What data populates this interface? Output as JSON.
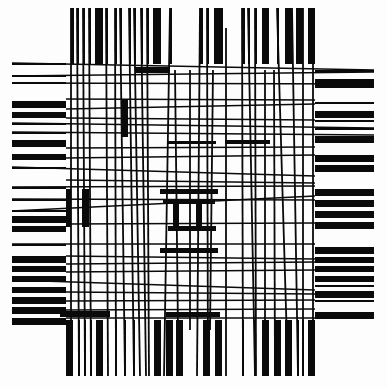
{
  "artwork": {
    "width": 387,
    "height": 389,
    "background": "#fdfdfd",
    "ink": "#0a0a0a",
    "top_bars": [
      {
        "x": 71,
        "w": 3
      },
      {
        "x": 77,
        "w": 2
      },
      {
        "x": 83,
        "w": 2
      },
      {
        "x": 89,
        "w": 2
      },
      {
        "x": 95,
        "w": 8
      },
      {
        "x": 106,
        "w": 2
      },
      {
        "x": 115,
        "w": 2
      },
      {
        "x": 120,
        "w": 2
      },
      {
        "x": 129,
        "w": 2
      },
      {
        "x": 134,
        "w": 2
      },
      {
        "x": 141,
        "w": 2
      },
      {
        "x": 147,
        "w": 2
      },
      {
        "x": 153,
        "w": 8
      },
      {
        "x": 170,
        "w": 2
      },
      {
        "x": 200,
        "w": 3
      },
      {
        "x": 207,
        "w": 2
      },
      {
        "x": 214,
        "w": 9
      },
      {
        "x": 242,
        "w": 3
      },
      {
        "x": 248,
        "w": 2
      },
      {
        "x": 255,
        "w": 2
      },
      {
        "x": 262,
        "w": 7
      },
      {
        "x": 277,
        "w": 2
      },
      {
        "x": 285,
        "w": 7
      },
      {
        "x": 296,
        "w": 7
      },
      {
        "x": 308,
        "w": 7
      }
    ],
    "bottom_bars": [
      {
        "x": 66,
        "w": 7
      },
      {
        "x": 78,
        "w": 2
      },
      {
        "x": 84,
        "w": 2
      },
      {
        "x": 90,
        "w": 2
      },
      {
        "x": 96,
        "w": 7
      },
      {
        "x": 115,
        "w": 2
      },
      {
        "x": 124,
        "w": 2
      },
      {
        "x": 133,
        "w": 2
      },
      {
        "x": 154,
        "w": 7
      },
      {
        "x": 166,
        "w": 7
      },
      {
        "x": 176,
        "w": 7
      },
      {
        "x": 203,
        "w": 7
      },
      {
        "x": 215,
        "w": 7
      },
      {
        "x": 242,
        "w": 2
      },
      {
        "x": 254,
        "w": 2
      },
      {
        "x": 262,
        "w": 7
      },
      {
        "x": 274,
        "w": 7
      },
      {
        "x": 285,
        "w": 7
      },
      {
        "x": 297,
        "w": 2
      },
      {
        "x": 302,
        "w": 2
      },
      {
        "x": 308,
        "w": 7
      }
    ],
    "left_bars": [
      {
        "y": 63,
        "h": 2
      },
      {
        "y": 75,
        "h": 2
      },
      {
        "y": 82,
        "h": 2
      },
      {
        "y": 101,
        "h": 7
      },
      {
        "y": 112,
        "h": 6
      },
      {
        "y": 123,
        "h": 2
      },
      {
        "y": 132,
        "h": 2
      },
      {
        "y": 140,
        "h": 7
      },
      {
        "y": 154,
        "h": 6
      },
      {
        "y": 167,
        "h": 2
      },
      {
        "y": 187,
        "h": 2
      },
      {
        "y": 199,
        "h": 2
      },
      {
        "y": 210,
        "h": 2
      },
      {
        "y": 216,
        "h": 7
      },
      {
        "y": 226,
        "h": 6
      },
      {
        "y": 244,
        "h": 2
      },
      {
        "y": 256,
        "h": 7
      },
      {
        "y": 266,
        "h": 6
      },
      {
        "y": 276,
        "h": 6
      },
      {
        "y": 287,
        "h": 6
      },
      {
        "y": 297,
        "h": 7
      },
      {
        "y": 307,
        "h": 7
      },
      {
        "y": 318,
        "h": 7
      }
    ],
    "right_bars": [
      {
        "y": 70,
        "h": 2
      },
      {
        "y": 79,
        "h": 9
      },
      {
        "y": 102,
        "h": 2
      },
      {
        "y": 111,
        "h": 7
      },
      {
        "y": 120,
        "h": 2
      },
      {
        "y": 128,
        "h": 2
      },
      {
        "y": 136,
        "h": 7
      },
      {
        "y": 155,
        "h": 7
      },
      {
        "y": 165,
        "h": 7
      },
      {
        "y": 189,
        "h": 7
      },
      {
        "y": 200,
        "h": 7
      },
      {
        "y": 211,
        "h": 7
      },
      {
        "y": 222,
        "h": 7
      },
      {
        "y": 247,
        "h": 7
      },
      {
        "y": 257,
        "h": 6
      },
      {
        "y": 266,
        "h": 6
      },
      {
        "y": 276,
        "h": 6
      },
      {
        "y": 285,
        "h": 2
      },
      {
        "y": 291,
        "h": 7
      },
      {
        "y": 300,
        "h": 2
      },
      {
        "y": 312,
        "h": 7
      }
    ],
    "h_lines": [
      {
        "x1": 12,
        "y1": 63,
        "x2": 374,
        "y2": 70
      },
      {
        "x1": 12,
        "y1": 76,
        "x2": 374,
        "y2": 72
      },
      {
        "x1": 12,
        "y1": 83,
        "x2": 374,
        "y2": 84
      },
      {
        "x1": 66,
        "y1": 99,
        "x2": 315,
        "y2": 100
      },
      {
        "x1": 66,
        "y1": 109,
        "x2": 315,
        "y2": 104
      },
      {
        "x1": 66,
        "y1": 118,
        "x2": 315,
        "y2": 120
      },
      {
        "x1": 12,
        "y1": 123,
        "x2": 374,
        "y2": 128
      },
      {
        "x1": 12,
        "y1": 132,
        "x2": 374,
        "y2": 135
      },
      {
        "x1": 66,
        "y1": 148,
        "x2": 315,
        "y2": 147
      },
      {
        "x1": 66,
        "y1": 158,
        "x2": 315,
        "y2": 155
      },
      {
        "x1": 12,
        "y1": 167,
        "x2": 315,
        "y2": 176
      },
      {
        "x1": 66,
        "y1": 180,
        "x2": 315,
        "y2": 183
      },
      {
        "x1": 12,
        "y1": 187,
        "x2": 315,
        "y2": 186
      },
      {
        "x1": 12,
        "y1": 199,
        "x2": 315,
        "y2": 200
      },
      {
        "x1": 12,
        "y1": 211,
        "x2": 315,
        "y2": 196
      },
      {
        "x1": 66,
        "y1": 224,
        "x2": 315,
        "y2": 223
      },
      {
        "x1": 12,
        "y1": 244,
        "x2": 315,
        "y2": 244
      },
      {
        "x1": 66,
        "y1": 256,
        "x2": 315,
        "y2": 259
      },
      {
        "x1": 66,
        "y1": 264,
        "x2": 315,
        "y2": 262
      },
      {
        "x1": 66,
        "y1": 272,
        "x2": 315,
        "y2": 270
      },
      {
        "x1": 12,
        "y1": 280,
        "x2": 315,
        "y2": 290
      },
      {
        "x1": 66,
        "y1": 292,
        "x2": 315,
        "y2": 294
      },
      {
        "x1": 66,
        "y1": 301,
        "x2": 315,
        "y2": 300
      },
      {
        "x1": 66,
        "y1": 310,
        "x2": 315,
        "y2": 309
      },
      {
        "x1": 66,
        "y1": 318,
        "x2": 315,
        "y2": 318
      }
    ],
    "v_lines": [
      {
        "x1": 71,
        "y1": 8,
        "x2": 71,
        "y2": 376
      },
      {
        "x1": 77,
        "y1": 8,
        "x2": 79,
        "y2": 376
      },
      {
        "x1": 83,
        "y1": 8,
        "x2": 85,
        "y2": 376
      },
      {
        "x1": 89,
        "y1": 8,
        "x2": 91,
        "y2": 376
      },
      {
        "x1": 106,
        "y1": 8,
        "x2": 108,
        "y2": 376
      },
      {
        "x1": 115,
        "y1": 8,
        "x2": 116,
        "y2": 376
      },
      {
        "x1": 120,
        "y1": 8,
        "x2": 125,
        "y2": 376
      },
      {
        "x1": 129,
        "y1": 8,
        "x2": 134,
        "y2": 376
      },
      {
        "x1": 134,
        "y1": 8,
        "x2": 140,
        "y2": 376
      },
      {
        "x1": 141,
        "y1": 8,
        "x2": 146,
        "y2": 376
      },
      {
        "x1": 147,
        "y1": 8,
        "x2": 149,
        "y2": 376
      },
      {
        "x1": 170,
        "y1": 8,
        "x2": 164,
        "y2": 376
      },
      {
        "x1": 200,
        "y1": 8,
        "x2": 197,
        "y2": 376
      },
      {
        "x1": 207,
        "y1": 8,
        "x2": 208,
        "y2": 376
      },
      {
        "x1": 242,
        "y1": 8,
        "x2": 243,
        "y2": 376
      },
      {
        "x1": 248,
        "y1": 8,
        "x2": 255,
        "y2": 376
      },
      {
        "x1": 255,
        "y1": 8,
        "x2": 256,
        "y2": 376
      },
      {
        "x1": 277,
        "y1": 8,
        "x2": 288,
        "y2": 376
      },
      {
        "x1": 292,
        "y1": 8,
        "x2": 298,
        "y2": 376
      },
      {
        "x1": 303,
        "y1": 8,
        "x2": 303,
        "y2": 376
      },
      {
        "x1": 313,
        "y1": 8,
        "x2": 313,
        "y2": 376
      },
      {
        "x1": 226,
        "y1": 28,
        "x2": 226,
        "y2": 376
      },
      {
        "x1": 190,
        "y1": 70,
        "x2": 190,
        "y2": 330
      },
      {
        "x1": 175,
        "y1": 70,
        "x2": 178,
        "y2": 330
      },
      {
        "x1": 213,
        "y1": 70,
        "x2": 210,
        "y2": 330
      },
      {
        "x1": 265,
        "y1": 70,
        "x2": 265,
        "y2": 376
      },
      {
        "x1": 274,
        "y1": 70,
        "x2": 275,
        "y2": 376
      }
    ],
    "blocks": [
      {
        "x": 135,
        "y": 67,
        "w": 35,
        "h": 6
      },
      {
        "x": 122,
        "y": 100,
        "w": 6,
        "h": 37
      },
      {
        "x": 66,
        "y": 189,
        "w": 5,
        "h": 38
      },
      {
        "x": 82,
        "y": 189,
        "w": 7,
        "h": 38
      },
      {
        "x": 168,
        "y": 141,
        "w": 48,
        "h": 3
      },
      {
        "x": 160,
        "y": 189,
        "w": 58,
        "h": 5
      },
      {
        "x": 163,
        "y": 200,
        "w": 52,
        "h": 4
      },
      {
        "x": 173,
        "y": 204,
        "w": 6,
        "h": 22
      },
      {
        "x": 196,
        "y": 204,
        "w": 6,
        "h": 22
      },
      {
        "x": 168,
        "y": 226,
        "w": 48,
        "h": 5
      },
      {
        "x": 160,
        "y": 248,
        "w": 58,
        "h": 5
      },
      {
        "x": 225,
        "y": 140,
        "w": 45,
        "h": 4
      },
      {
        "x": 166,
        "y": 312,
        "w": 54,
        "h": 5
      },
      {
        "x": 60,
        "y": 311,
        "w": 50,
        "h": 6
      }
    ],
    "frame": {
      "top_bars_y": [
        8,
        64
      ],
      "bottom_bars_y": [
        320,
        376
      ],
      "left_bars_x": [
        12,
        66
      ],
      "right_bars_x": [
        315,
        374
      ]
    }
  }
}
